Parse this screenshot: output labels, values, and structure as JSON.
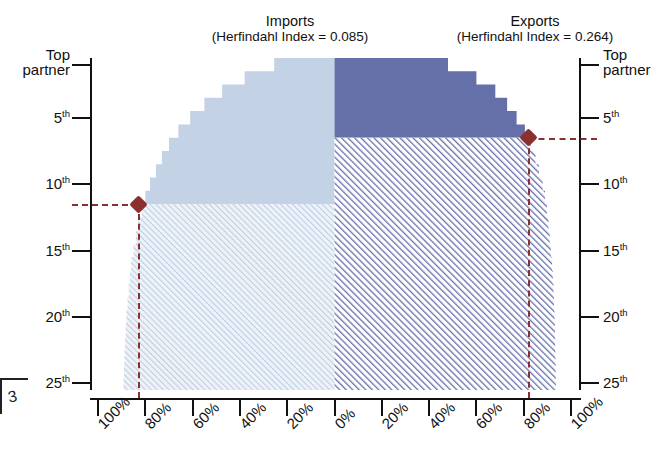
{
  "figure": {
    "top_clipped_text": "",
    "page_marker": "3"
  },
  "panels": {
    "imports": {
      "title": "Imports",
      "subtitle": "(Herfindahl Index = 0.085)",
      "fill_color": "#c3d2e4",
      "hatch_color": "#b9cce0",
      "herfindahl_index": 0.085,
      "marker": {
        "rank": 11,
        "share_pct": 83
      }
    },
    "exports": {
      "title": "Exports",
      "subtitle": "(Herfindahl Index = 0.264)",
      "fill_color": "#6670a8",
      "hatch_color": "#6670a8",
      "herfindahl_index": 0.264,
      "marker": {
        "rank": 6,
        "share_pct": 82
      }
    }
  },
  "axes": {
    "y_left_label_ticks": [
      "Top partner",
      "5th",
      "10th",
      "15th",
      "20th",
      "25th"
    ],
    "y_right_label_ticks": [
      "Top partner",
      "5th",
      "10th",
      "15th",
      "20th",
      "25th"
    ],
    "y_ranks": [
      1,
      5,
      10,
      15,
      20,
      25
    ],
    "x_left_ticks": [
      "100%",
      "80%",
      "60%",
      "40%",
      "20%",
      "0%"
    ],
    "x_right_ticks": [
      "0%",
      "20%",
      "40%",
      "60%",
      "80%",
      "100%"
    ],
    "x_left_values": [
      100,
      80,
      60,
      40,
      20,
      0
    ],
    "x_right_values": [
      0,
      20,
      40,
      60,
      80,
      100
    ]
  },
  "colors": {
    "imports_fill": "#c3d2e4",
    "exports_fill": "#6670a8",
    "marker": "#8c2f2f",
    "axis": "#111111",
    "hatch_light": "#b9cce0",
    "hatch_dark": "#6670a8"
  },
  "chart_data": {
    "type": "area",
    "subtitle": "Back-to-back stepped cumulative share (Lorenz-style) for Imports and Exports",
    "orientation": "horizontal-mirrored",
    "xlabel": "",
    "ylabel": "Partner rank",
    "xlim": [
      -100,
      100
    ],
    "ylim": [
      25.5,
      0.5
    ],
    "grid": false,
    "legend": "none",
    "y_tick_values": [
      1,
      5,
      10,
      15,
      20,
      25
    ],
    "y_tick_labels": [
      "Top partner",
      "5th",
      "10th",
      "15th",
      "20th",
      "25th"
    ],
    "x_tick_values": [
      -100,
      -80,
      -60,
      -40,
      -20,
      0,
      20,
      40,
      60,
      80,
      100
    ],
    "x_tick_labels": [
      "100%",
      "80%",
      "60%",
      "40%",
      "20%",
      "0%",
      "20%",
      "40%",
      "60%",
      "80%",
      "100%"
    ],
    "annotations": [
      {
        "text": "Imports (Herfindahl Index = 0.085)",
        "side": "left"
      },
      {
        "text": "Exports (Herfindahl Index = 0.264)",
        "side": "right"
      },
      {
        "text": "marker at 11th partner, ~83% cumulative imports",
        "side": "left"
      },
      {
        "text": "marker at 6th partner, ~82% cumulative exports",
        "side": "right"
      }
    ],
    "series": [
      {
        "name": "Imports cumulative share",
        "side": "left",
        "color": "#c3d2e4",
        "ranks": [
          1,
          2,
          3,
          4,
          5,
          6,
          7,
          8,
          9,
          10,
          11,
          12,
          13,
          14,
          15,
          16,
          17,
          18,
          19,
          20,
          21,
          22,
          23,
          24,
          25
        ],
        "cumulative_share_pct": [
          25.5,
          38.0,
          47.5,
          55.0,
          61.0,
          66.0,
          70.0,
          73.0,
          75.5,
          78.0,
          80.0,
          81.5,
          83.0,
          84.0,
          85.0,
          86.0,
          86.5,
          87.0,
          87.5,
          88.0,
          88.3,
          88.6,
          88.8,
          89.0,
          89.2
        ],
        "solid_to_rank": 11,
        "hatched_from_rank": 11
      },
      {
        "name": "Exports cumulative share",
        "side": "right",
        "color": "#6670a8",
        "ranks": [
          1,
          2,
          3,
          4,
          5,
          6,
          7,
          8,
          9,
          10,
          11,
          12,
          13,
          14,
          15,
          16,
          17,
          18,
          19,
          20,
          21,
          22,
          23,
          24,
          25
        ],
        "cumulative_share_pct": [
          48.0,
          60.0,
          68.0,
          73.0,
          77.0,
          80.5,
          83.0,
          85.0,
          86.5,
          88.0,
          89.0,
          89.8,
          90.5,
          91.0,
          91.5,
          92.0,
          92.3,
          92.6,
          92.8,
          93.0,
          93.2,
          93.3,
          93.4,
          93.5,
          93.6
        ],
        "solid_to_rank": 6,
        "hatched_from_rank": 6
      }
    ]
  }
}
